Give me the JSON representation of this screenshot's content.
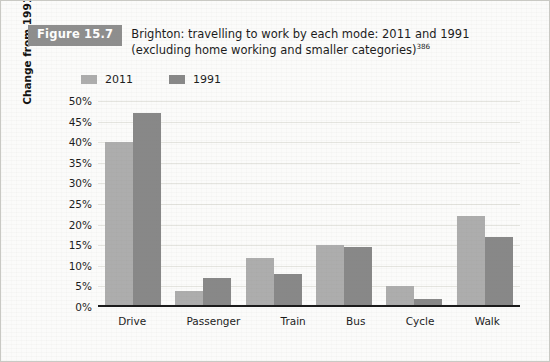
{
  "figure": {
    "badge_label": "Figure 15.7",
    "title_line1": "Brighton: travelling to work by each mode: 2011 and 1991",
    "title_line2": "(excluding home working and smaller categories)",
    "title_superscript": "386"
  },
  "colors": {
    "badge_background": "#8e8e8e",
    "series_2011": "#adadad",
    "series_1991": "#888888",
    "gridline": "#e4e4df",
    "axis": "#1a1a1a",
    "paper": "#fbfbfa",
    "border": "#c9c9c4"
  },
  "legend": {
    "position": "top-left",
    "entries": [
      {
        "label": "2011",
        "color": "#adadad"
      },
      {
        "label": "1991",
        "color": "#888888"
      }
    ]
  },
  "chart_data": {
    "type": "bar",
    "title": "Brighton: travelling to work by each mode: 2011 and 1991 (excluding home working and smaller categories)",
    "xlabel": "",
    "ylabel": "Change from 1991 to 2011",
    "categories": [
      "Drive",
      "Passenger",
      "Train",
      "Bus",
      "Cycle",
      "Walk"
    ],
    "series": [
      {
        "name": "2011",
        "color": "#adadad",
        "values": [
          40,
          4,
          12,
          15,
          5,
          22
        ]
      },
      {
        "name": "1991",
        "color": "#888888",
        "values": [
          47,
          7,
          8,
          14.5,
          2,
          17
        ]
      }
    ],
    "ylim": [
      0,
      50
    ],
    "ytick_step": 5,
    "ytick_labels": [
      "50%",
      "45%",
      "40%",
      "35%",
      "30%",
      "25%",
      "20%",
      "15%",
      "10%",
      "5%",
      "0%"
    ],
    "ytick_values": [
      50,
      45,
      40,
      35,
      30,
      25,
      20,
      15,
      10,
      5,
      0
    ],
    "grid": "horizontal",
    "legend_position": "top-left",
    "value_unit": "%"
  }
}
